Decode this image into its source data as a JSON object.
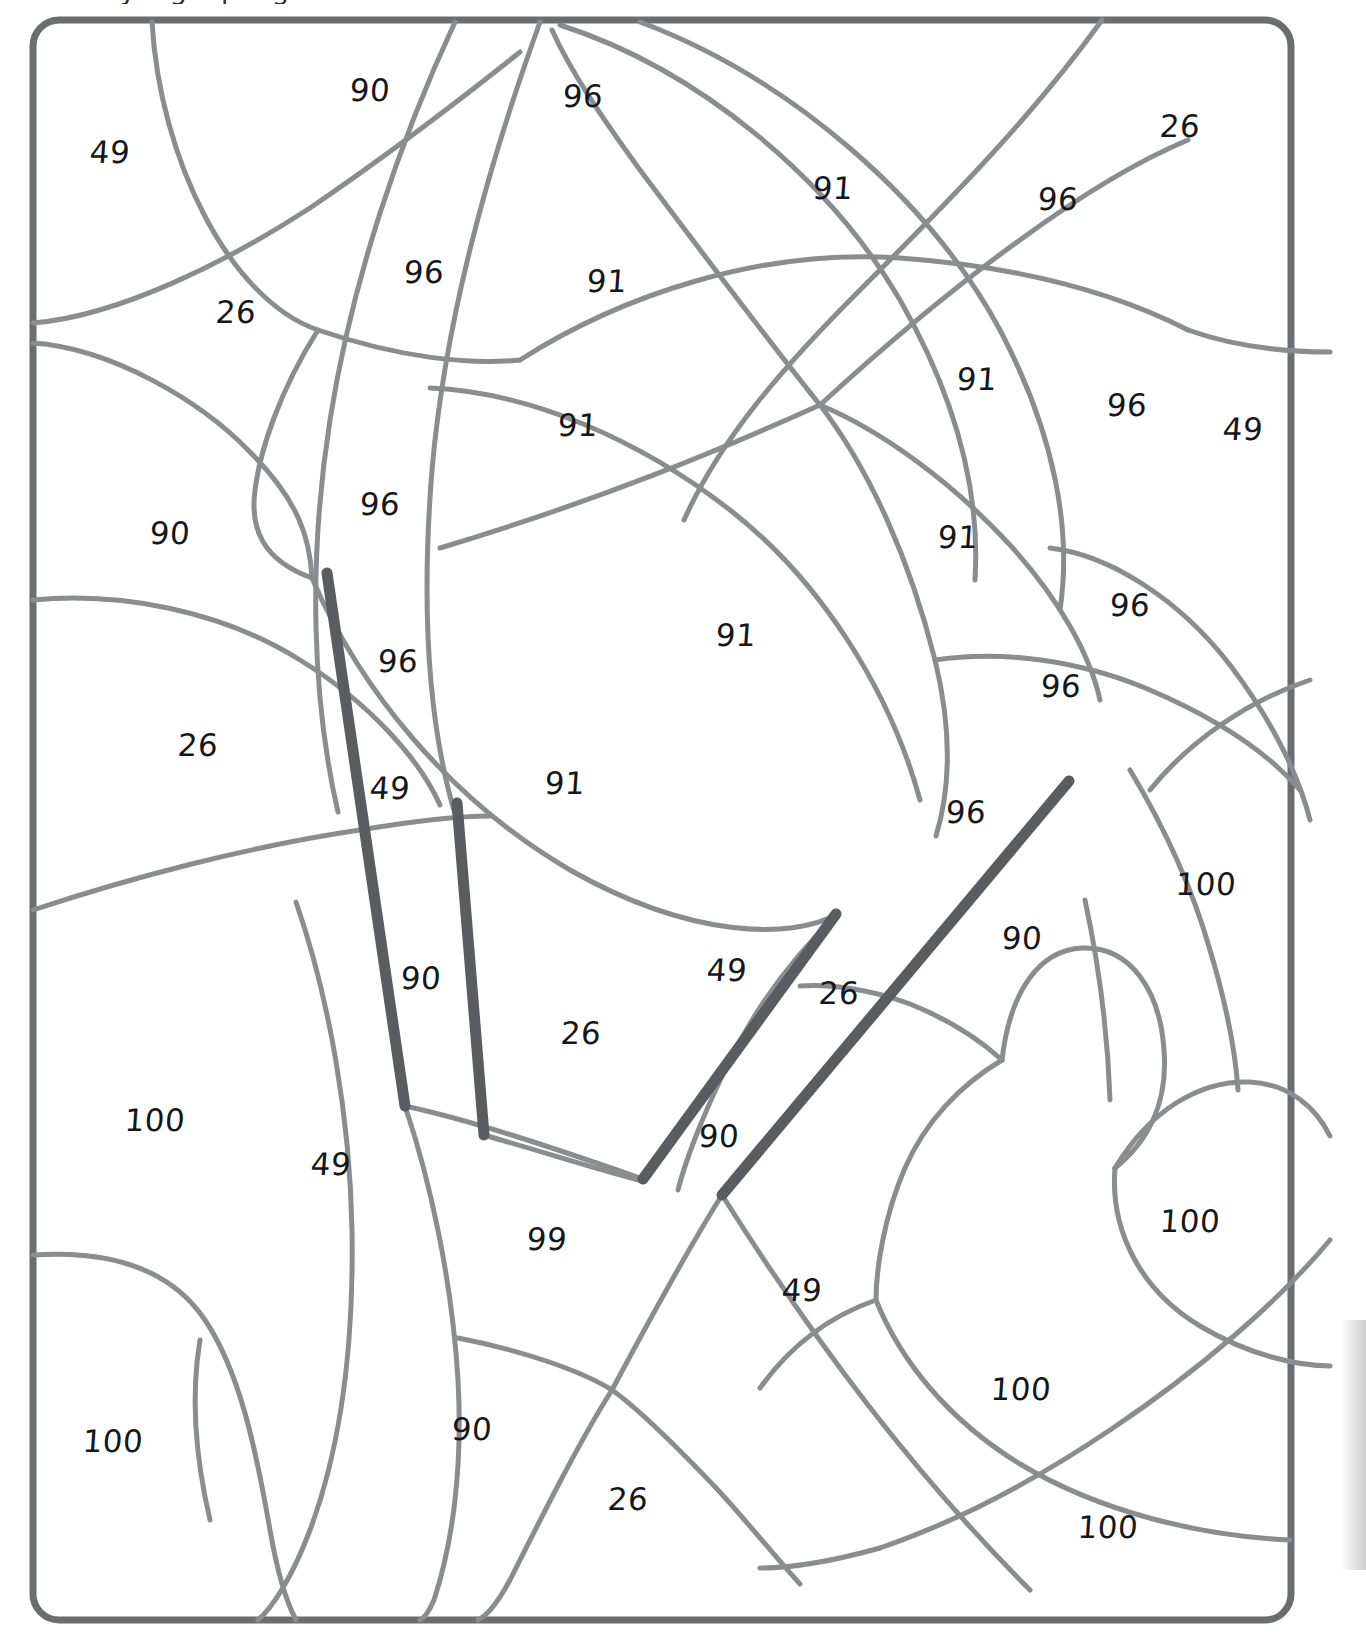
{
  "page": {
    "title_fragment": "y   a   g   u   p   e   g",
    "width": 1366,
    "height": 1637,
    "background_color": "#ffffff"
  },
  "colors": {
    "frame_stroke": "#6b6d70",
    "region_stroke": "#8a8c8f",
    "highlight_stroke": "#5a5c60",
    "label_text": "#15171a"
  },
  "board": {
    "name": "curved-region-puzzle-board",
    "frame": {
      "x": 33,
      "y": 20,
      "width": 1258,
      "height": 1600,
      "corner_radius": 26,
      "stroke_width": 7
    }
  },
  "region_labels": [
    {
      "value": "90",
      "x": 370,
      "y": 90
    },
    {
      "value": "96",
      "x": 583,
      "y": 96
    },
    {
      "value": "26",
      "x": 1180,
      "y": 126
    },
    {
      "value": "49",
      "x": 110,
      "y": 152
    },
    {
      "value": "91",
      "x": 833,
      "y": 188
    },
    {
      "value": "96",
      "x": 1058,
      "y": 199
    },
    {
      "value": "96",
      "x": 424,
      "y": 272
    },
    {
      "value": "91",
      "x": 607,
      "y": 281
    },
    {
      "value": "26",
      "x": 236,
      "y": 312
    },
    {
      "value": "91",
      "x": 977,
      "y": 379
    },
    {
      "value": "96",
      "x": 1127,
      "y": 405
    },
    {
      "value": "91",
      "x": 578,
      "y": 425
    },
    {
      "value": "49",
      "x": 1243,
      "y": 429
    },
    {
      "value": "96",
      "x": 380,
      "y": 504
    },
    {
      "value": "90",
      "x": 170,
      "y": 533
    },
    {
      "value": "91",
      "x": 958,
      "y": 537
    },
    {
      "value": "96",
      "x": 1130,
      "y": 605
    },
    {
      "value": "96",
      "x": 398,
      "y": 661
    },
    {
      "value": "96",
      "x": 1061,
      "y": 686
    },
    {
      "value": "26",
      "x": 198,
      "y": 745
    },
    {
      "value": "91",
      "x": 736,
      "y": 635
    },
    {
      "value": "49",
      "x": 390,
      "y": 788
    },
    {
      "value": "91",
      "x": 565,
      "y": 783
    },
    {
      "value": "96",
      "x": 966,
      "y": 812
    },
    {
      "value": "100",
      "x": 1206,
      "y": 884
    },
    {
      "value": "90",
      "x": 1022,
      "y": 938
    },
    {
      "value": "49",
      "x": 727,
      "y": 970
    },
    {
      "value": "90",
      "x": 421,
      "y": 978
    },
    {
      "value": "26",
      "x": 839,
      "y": 993
    },
    {
      "value": "26",
      "x": 581,
      "y": 1033
    },
    {
      "value": "100",
      "x": 155,
      "y": 1120
    },
    {
      "value": "90",
      "x": 719,
      "y": 1136
    },
    {
      "value": "49",
      "x": 331,
      "y": 1164
    },
    {
      "value": "99",
      "x": 547,
      "y": 1239
    },
    {
      "value": "100",
      "x": 1190,
      "y": 1221
    },
    {
      "value": "49",
      "x": 802,
      "y": 1290
    },
    {
      "value": "100",
      "x": 113,
      "y": 1441
    },
    {
      "value": "100",
      "x": 1021,
      "y": 1389
    },
    {
      "value": "90",
      "x": 472,
      "y": 1429
    },
    {
      "value": "26",
      "x": 628,
      "y": 1499
    },
    {
      "value": "100",
      "x": 1108,
      "y": 1527
    }
  ],
  "highlight_segments": [
    {
      "name": "bar-left-outer",
      "x1": 327,
      "y1": 573,
      "x2": 405,
      "y2": 1106
    },
    {
      "name": "bar-left-inner",
      "x1": 457,
      "y1": 803,
      "x2": 484,
      "y2": 1135
    },
    {
      "name": "bar-right-upper",
      "x1": 643,
      "y1": 1179,
      "x2": 836,
      "y2": 914
    },
    {
      "name": "bar-right-lower",
      "x1": 722,
      "y1": 1195,
      "x2": 1069,
      "y2": 781
    }
  ]
}
